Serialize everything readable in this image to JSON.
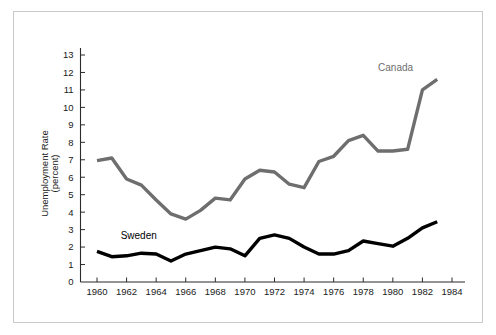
{
  "figure": {
    "background_color": "#ffffff",
    "frame_color": "#c9c9c9"
  },
  "chart_data": {
    "type": "line",
    "title": "",
    "xlabel": "",
    "ylabel": "Unemployment Rate (percent)",
    "ylabel_line1": "Unemployment Rate",
    "ylabel_line2": "(percent)",
    "xlim": [
      1959,
      1985
    ],
    "ylim": [
      0,
      13.6
    ],
    "grid": false,
    "legend_position": "inline-annotations",
    "x": [
      1960,
      1961,
      1962,
      1963,
      1964,
      1965,
      1966,
      1967,
      1968,
      1969,
      1970,
      1971,
      1972,
      1973,
      1974,
      1975,
      1976,
      1977,
      1978,
      1979,
      1980,
      1981,
      1982,
      1983
    ],
    "xticks": [
      1960,
      1962,
      1964,
      1966,
      1968,
      1970,
      1972,
      1974,
      1976,
      1978,
      1980,
      1982,
      1984
    ],
    "xtick_labels": [
      "1960",
      "1962",
      "1964",
      "1966",
      "1968",
      "1970",
      "1972",
      "1974",
      "1976",
      "1978",
      "1980",
      "1982",
      "1984"
    ],
    "yticks": [
      0,
      1,
      2,
      3,
      4,
      5,
      6,
      7,
      8,
      9,
      10,
      11,
      12,
      13
    ],
    "ytick_labels": [
      "0",
      "1",
      "2",
      "3",
      "4",
      "5",
      "6",
      "7",
      "8",
      "9",
      "10",
      "11",
      "12",
      "13"
    ],
    "series": [
      {
        "name": "Canada",
        "color": "#6e6e6e",
        "line_width": 3.4,
        "label_x": 1979.0,
        "label_y": 12.1,
        "values": [
          6.95,
          7.1,
          5.9,
          5.55,
          4.7,
          3.9,
          3.6,
          4.1,
          4.8,
          4.7,
          5.9,
          6.4,
          6.3,
          5.6,
          5.4,
          6.9,
          7.2,
          8.1,
          8.4,
          7.5,
          7.5,
          7.6,
          11.0,
          11.6
        ]
      },
      {
        "name": "Sweden",
        "color": "#000000",
        "line_width": 3.4,
        "label_x": 1961.6,
        "label_y": 2.45,
        "values": [
          1.75,
          1.45,
          1.5,
          1.65,
          1.6,
          1.2,
          1.6,
          1.8,
          2.0,
          1.9,
          1.5,
          2.5,
          2.7,
          2.5,
          2.0,
          1.6,
          1.6,
          1.8,
          2.35,
          2.2,
          2.05,
          2.5,
          3.1,
          3.45
        ]
      }
    ]
  }
}
